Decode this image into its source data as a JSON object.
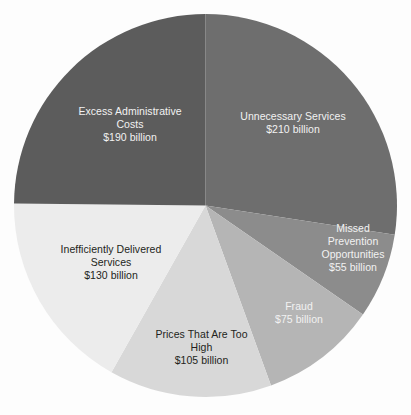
{
  "chart_data": {
    "type": "pie",
    "title": "",
    "subtitle": "",
    "unit": "billion USD",
    "total": 765,
    "legend": "none",
    "labels_inside_slices": true,
    "start_angle_deg": 0,
    "direction": "clockwise",
    "categories": [
      "Unnecessary Services",
      "Missed Prevention Opportunities",
      "Fraud",
      "Prices That Are Too High",
      "Inefficiently Delivered Services",
      "Excess Administrative Costs"
    ],
    "values": [
      210,
      55,
      75,
      105,
      130,
      190
    ],
    "value_labels": [
      "$210 billion",
      "$55 billion",
      "$75 billion",
      "$105 billion",
      "$130 billion",
      "$190 billion"
    ],
    "percentages": [
      27.45,
      7.19,
      9.8,
      13.73,
      16.99,
      24.84
    ],
    "colors": [
      "#6e6e6e",
      "#8c8c8c",
      "#b5b5b5",
      "#d8d8d8",
      "#ececec",
      "#5c5c5c"
    ]
  },
  "slices": [
    {
      "id": "unnecessary-services",
      "name_line1": "Unnecessary Services",
      "name_line2": "",
      "name_line3": "",
      "value_label": "$210 billion",
      "value": 210,
      "color": "#6e6e6e",
      "text_color": "#f2f2f2"
    },
    {
      "id": "missed-prevention-opportunities",
      "name_line1": "Missed",
      "name_line2": "Prevention",
      "name_line3": "Opportunities",
      "value_label": "$55 billion",
      "value": 55,
      "color": "#8c8c8c",
      "text_color": "#f2f2f2"
    },
    {
      "id": "fraud",
      "name_line1": "Fraud",
      "name_line2": "",
      "name_line3": "",
      "value_label": "$75 billion",
      "value": 75,
      "color": "#b5b5b5",
      "text_color": "#f2f2f2"
    },
    {
      "id": "prices-that-are-too-high",
      "name_line1": "Prices That Are Too",
      "name_line2": "High",
      "name_line3": "",
      "value_label": "$105 billion",
      "value": 105,
      "color": "#d8d8d8",
      "text_color": "#231f20"
    },
    {
      "id": "inefficiently-delivered-services",
      "name_line1": "Inefficiently Delivered",
      "name_line2": "Services",
      "name_line3": "",
      "value_label": "$130 billion",
      "value": 130,
      "color": "#ececec",
      "text_color": "#231f20"
    },
    {
      "id": "excess-administrative-costs",
      "name_line1": "Excess Administrative",
      "name_line2": "Costs",
      "name_line3": "",
      "value_label": "$190 billion",
      "value": 190,
      "color": "#5c5c5c",
      "text_color": "#f2f2f2"
    }
  ]
}
